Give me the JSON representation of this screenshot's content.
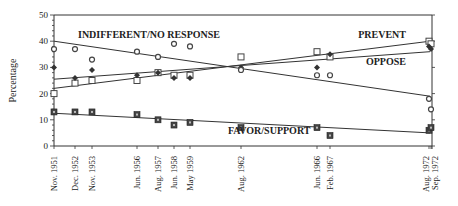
{
  "chart_data": {
    "type": "scatter",
    "title": "",
    "xlabel": "",
    "ylabel": "Percentage",
    "ylim": [
      0,
      50
    ],
    "yticks": [
      0,
      10,
      20,
      30,
      40,
      50
    ],
    "grid": false,
    "categories": [
      "Nov. 1951",
      "Dec. 1952",
      "Nov. 1953",
      "Jun. 1956",
      "Aug. 1957",
      "Jun. 1958",
      "May 1959",
      "Aug. 1962",
      "Jun. 1966",
      "Feb. 1967",
      "Aug. 1972",
      "Sep. 1972"
    ],
    "series": [
      {
        "name": "PREVENT",
        "marker": "open-square",
        "values": [
          20,
          24,
          25,
          25,
          28,
          27,
          27,
          34,
          36,
          34,
          40,
          39
        ]
      },
      {
        "name": "OPPOSE",
        "marker": "filled-diamond",
        "values": [
          30,
          26,
          29,
          27,
          28,
          26,
          26,
          30,
          30,
          35,
          38,
          37
        ]
      },
      {
        "name": "INDIFFERENT/NO RESPONSE",
        "marker": "open-circle",
        "values": [
          37,
          37,
          33,
          36,
          34,
          39,
          38,
          29,
          27,
          27,
          18,
          14
        ]
      },
      {
        "name": "FAVOR/SUPPORT",
        "marker": "filled-square",
        "values": [
          13,
          13,
          13,
          12,
          10,
          8,
          9,
          7,
          7,
          4,
          6,
          7
        ]
      }
    ],
    "trendlines": [
      {
        "name": "PREVENT",
        "start": 22,
        "end": 40
      },
      {
        "name": "OPPOSE",
        "start": 25.5,
        "end": 36
      },
      {
        "name": "INDIFFERENT/NO RESPONSE",
        "start": 40,
        "end": 19
      },
      {
        "name": "FAVOR/SUPPORT",
        "start": 12.5,
        "end": 5
      }
    ],
    "annotations": [
      "INDIFFERENT/NO RESPONSE",
      "PREVENT",
      "OPPOSE",
      "FAVOR/SUPPORT"
    ]
  }
}
